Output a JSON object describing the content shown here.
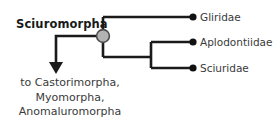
{
  "diagram": {
    "type": "cladogram",
    "clade_label": "Sciuromorpha",
    "root_node": {
      "name": "sciuromorpha-node",
      "style": "filled-circle",
      "fill_color": "#b3b3b3",
      "stroke_color": "#4d4d4d"
    },
    "branch_color": "#1a1a1a",
    "tip_marker_color": "#111111",
    "tips": [
      {
        "label": "Gliridae"
      },
      {
        "label": "Aplodontiidae"
      },
      {
        "label": "Sciuridae"
      }
    ],
    "outgroup_arrow": {
      "direction": "down",
      "lines": [
        "to Castorimorpha,",
        "Myomorpha,",
        "Anomaluromorpha"
      ]
    }
  }
}
